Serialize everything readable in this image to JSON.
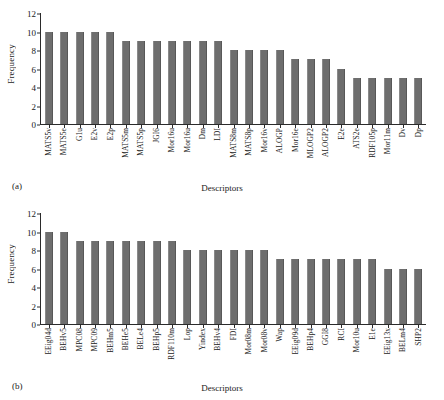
{
  "figure": {
    "panels": [
      {
        "letter": "(a)",
        "ylabel": "Frequency",
        "xlabel": "Descriptors"
      },
      {
        "letter": "(b)",
        "ylabel": "Frequency",
        "xlabel": "Descriptors"
      }
    ],
    "bar_color": "#6e6e6e",
    "axis_color": "#2b2b2b",
    "background": "#ffffff"
  },
  "chart_data": [
    {
      "type": "bar",
      "title": "(a)",
      "xlabel": "Descriptors",
      "ylabel": "Frequency",
      "ylim": [
        0,
        12
      ],
      "yticks": [
        0,
        2,
        4,
        6,
        8,
        10,
        12
      ],
      "grid": false,
      "legend": null,
      "categories": [
        "MATS5v",
        "MATS5e",
        "G1u",
        "E2v",
        "E2p",
        "MATS5m",
        "MATS5p",
        "JGI6",
        "Mor16u",
        "Mor16u",
        "Dm",
        "LDI",
        "MATS8m",
        "MATS8p",
        "Mor16v",
        "ALOGP",
        "Mor16e",
        "MLOGP2",
        "ALOGP2",
        "E2e",
        "ATS2e",
        "RDF105p",
        "Mor11m",
        "Dv",
        "Dp"
      ],
      "values": [
        10,
        10,
        10,
        10,
        10,
        9,
        9,
        9,
        9,
        9,
        9,
        9,
        8,
        8,
        8,
        8,
        7,
        7,
        7,
        6,
        5,
        5,
        5,
        5,
        5
      ]
    },
    {
      "type": "bar",
      "title": "(b)",
      "xlabel": "Descriptors",
      "ylabel": "Frequency",
      "ylim": [
        0,
        12
      ],
      "yticks": [
        0,
        2,
        4,
        6,
        8,
        10,
        12
      ],
      "grid": false,
      "legend": null,
      "categories": [
        "EEig04d",
        "BEHv5",
        "MPC08",
        "MPC09",
        "BEHm5",
        "BEHe5",
        "BELe4",
        "BEHp5",
        "RDF110m",
        "Lop",
        "Yindex",
        "BEHv4",
        "FDI",
        "Mor08m",
        "Mor08v",
        "Wap",
        "EEig09d",
        "BEHp4",
        "GGI8",
        "RCI",
        "Mor10u",
        "E1e",
        "EEig13x",
        "BELm4",
        "SHP2"
      ],
      "values": [
        10,
        10,
        9,
        9,
        9,
        9,
        9,
        9,
        9,
        8,
        8,
        8,
        8,
        8,
        8,
        7,
        7,
        7,
        7,
        7,
        7,
        7,
        6,
        6,
        6
      ]
    }
  ]
}
